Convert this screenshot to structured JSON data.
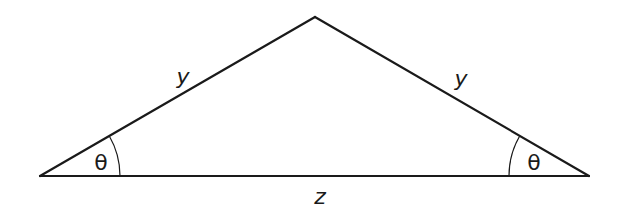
{
  "diagram": {
    "type": "isosceles-triangle",
    "vertices": {
      "apex": [
        315,
        17
      ],
      "left": [
        40,
        176
      ],
      "right": [
        589,
        176
      ]
    },
    "sides": [
      {
        "id": "left",
        "label": "y",
        "pos": [
          183,
          84
        ]
      },
      {
        "id": "right",
        "label": "y",
        "pos": [
          461,
          86
        ]
      },
      {
        "id": "base",
        "label": "z",
        "pos": [
          320,
          204
        ]
      }
    ],
    "angles": [
      {
        "id": "left",
        "label": "θ",
        "pos": [
          101,
          170
        ]
      },
      {
        "id": "right",
        "label": "θ",
        "pos": [
          534,
          170
        ]
      }
    ],
    "colors": {
      "stroke": "#1a1a1a",
      "background": "#ffffff"
    }
  }
}
